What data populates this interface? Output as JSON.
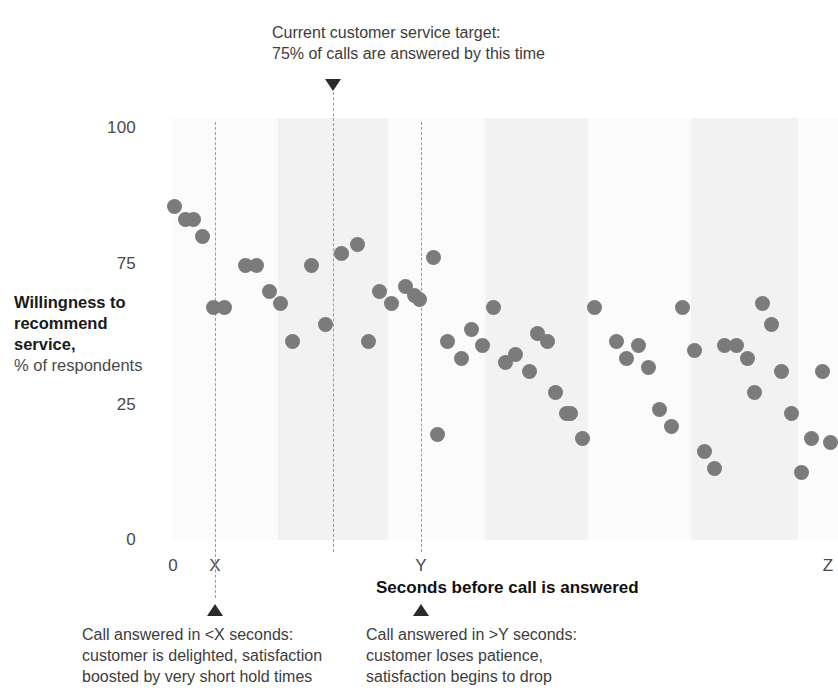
{
  "annotations": {
    "target": {
      "line1": "Current customer service target:",
      "line2": "75% of calls are answered by this time"
    },
    "left": {
      "line1": "Call answered in <X seconds:",
      "line2": "customer is delighted, satisfaction",
      "line3": "boosted by very short hold times"
    },
    "right": {
      "line1": "Call answered in >Y seconds:",
      "line2": "customer loses patience,",
      "line3": "satisfaction begins to drop"
    }
  },
  "axes": {
    "y_title_strong": "Willingness to recommend service,",
    "y_title_sub": "% of respondents",
    "y_ticks": [
      "100",
      "75",
      "25",
      "0"
    ],
    "x_title": "Seconds before call is answered",
    "x_ticks": [
      "0",
      "X",
      "Y",
      "Z"
    ]
  },
  "colors": {
    "dot": "#7b7b7b",
    "band": "#f2f2f2",
    "dashed_line": "#9a9a9a",
    "text": "#3d3d3d",
    "marker": "#2b2b2b"
  },
  "chart_data": {
    "type": "scatter",
    "title": "",
    "xlabel": "Seconds before call is answered",
    "ylabel": "Willingness to recommend service, % of respondents",
    "xlim": [
      0,
      100
    ],
    "ylim": [
      0,
      100
    ],
    "x_tick_labels": [
      "0",
      "X",
      "Y",
      "Z"
    ],
    "x_tick_values": [
      0,
      6.5,
      38,
      99
    ],
    "y_tick_labels": [
      "100",
      "75",
      "25",
      "0"
    ],
    "y_tick_values": [
      100,
      75,
      25,
      0
    ],
    "grid": false,
    "legend": null,
    "reference_lines": [
      {
        "name": "X threshold",
        "x": 6.5,
        "style": "dashed"
      },
      {
        "name": "service target",
        "x": 24.5,
        "style": "dashed"
      },
      {
        "name": "Y threshold",
        "x": 38,
        "style": "dashed"
      }
    ],
    "series": [
      {
        "name": "Respondents",
        "points": [
          [
            0.3,
            79
          ],
          [
            2.0,
            76
          ],
          [
            3.2,
            76
          ],
          [
            4.6,
            72
          ],
          [
            6.2,
            55
          ],
          [
            7.9,
            55
          ],
          [
            11.0,
            65
          ],
          [
            12.7,
            65
          ],
          [
            14.6,
            59
          ],
          [
            16.3,
            56
          ],
          [
            18.1,
            47
          ],
          [
            21.0,
            65
          ],
          [
            23.0,
            51
          ],
          [
            25.5,
            68
          ],
          [
            27.8,
            70
          ],
          [
            29.5,
            47
          ],
          [
            31.1,
            59
          ],
          [
            33.0,
            56
          ],
          [
            35.0,
            60
          ],
          [
            36.4,
            58
          ],
          [
            37.2,
            57
          ],
          [
            39.3,
            67
          ],
          [
            39.8,
            25
          ],
          [
            41.3,
            47
          ],
          [
            43.4,
            43
          ],
          [
            45.0,
            50
          ],
          [
            46.6,
            46
          ],
          [
            48.3,
            55
          ],
          [
            50.0,
            42
          ],
          [
            51.6,
            44
          ],
          [
            53.6,
            40
          ],
          [
            54.8,
            49
          ],
          [
            56.3,
            47
          ],
          [
            57.6,
            35
          ],
          [
            59.2,
            30
          ],
          [
            59.9,
            30
          ],
          [
            61.7,
            24
          ],
          [
            63.5,
            55
          ],
          [
            66.8,
            47
          ],
          [
            68.2,
            43
          ],
          [
            70.0,
            46
          ],
          [
            71.5,
            41
          ],
          [
            73.2,
            31
          ],
          [
            75.0,
            27
          ],
          [
            76.7,
            55
          ],
          [
            78.4,
            45
          ],
          [
            80.0,
            21
          ],
          [
            81.5,
            17
          ],
          [
            83.0,
            46
          ],
          [
            84.7,
            46
          ],
          [
            86.4,
            43
          ],
          [
            87.5,
            35
          ],
          [
            88.7,
            56
          ],
          [
            90.0,
            51
          ],
          [
            91.5,
            40
          ],
          [
            93.0,
            30
          ],
          [
            94.5,
            16
          ],
          [
            96.0,
            24
          ],
          [
            97.6,
            40
          ],
          [
            98.8,
            23
          ]
        ]
      }
    ]
  },
  "bands": [
    {
      "x_start": 14.8,
      "x_width": 16.5
    },
    {
      "x_start": 46.0,
      "x_width": 15.5
    },
    {
      "x_start": 77.0,
      "x_width": 16.0
    }
  ]
}
